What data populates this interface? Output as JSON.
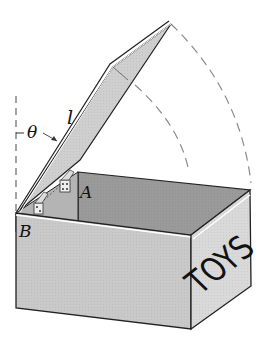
{
  "figure": {
    "labels": {
      "theta": "θ",
      "length": "l",
      "hinge_a": "A",
      "hinge_b": "B",
      "box_text": "TOYS"
    },
    "colors": {
      "outline": "#222222",
      "front_face": "#c9c9c9",
      "side_face": "#d6d6d6",
      "inner_wall": "#9a9a9a",
      "lid": "#cfcfcf",
      "dashed_arc": "#8a8a8a"
    }
  }
}
